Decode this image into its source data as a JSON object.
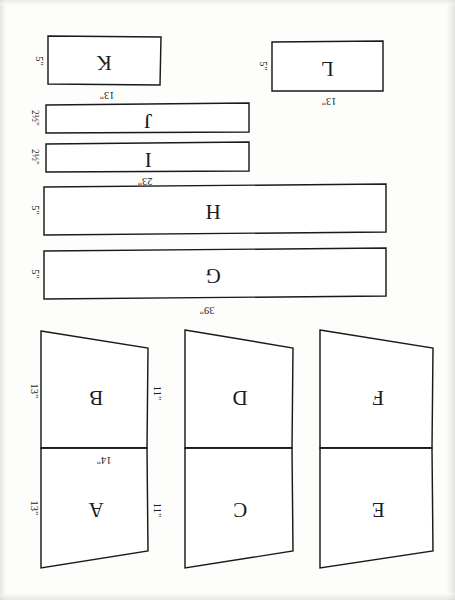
{
  "document": {
    "title": "Hand-drawn pattern cutting layout",
    "orientation_note": "All lettering is rotated 180 degrees",
    "ink_color": "#1a1a1a",
    "paper_color": "#fdfdfb"
  },
  "pieces": [
    {
      "id": "K",
      "label": "K",
      "shape": "rectangle",
      "height_label": "5\"",
      "width_label": "13\"",
      "x": 48,
      "y": 36,
      "w": 113,
      "h": 49
    },
    {
      "id": "L",
      "label": "L",
      "shape": "rectangle",
      "height_label": "5\"",
      "width_label": "13\"",
      "x": 272,
      "y": 41,
      "w": 111,
      "h": 50
    },
    {
      "id": "J",
      "label": "J",
      "shape": "rectangle",
      "height_label": "2½\"",
      "width_label": "23\"",
      "x": 46,
      "y": 104,
      "w": 203,
      "h": 28
    },
    {
      "id": "I",
      "label": "I",
      "shape": "rectangle",
      "height_label": "2½\"",
      "width_label": "23\"",
      "x": 46,
      "y": 142,
      "w": 203,
      "h": 28
    },
    {
      "id": "H",
      "label": "H",
      "shape": "rectangle",
      "height_label": "5\"",
      "width_label": "",
      "x": 44,
      "y": 185,
      "w": 342,
      "h": 48
    },
    {
      "id": "G",
      "label": "G",
      "shape": "rectangle",
      "height_label": "5\"",
      "width_label": "39\"",
      "x": 44,
      "y": 249,
      "w": 342,
      "h": 48
    },
    {
      "id": "B",
      "label": "B",
      "shape": "trapezoid",
      "left_label": "13\"",
      "right_label": "11\"",
      "bottom_label": "14\""
    },
    {
      "id": "A",
      "label": "A",
      "shape": "trapezoid",
      "left_label": "13\"",
      "right_label": "11\"",
      "bottom_label": ""
    },
    {
      "id": "D",
      "label": "D",
      "shape": "trapezoid",
      "left_label": "",
      "right_label": "",
      "bottom_label": ""
    },
    {
      "id": "C",
      "label": "C",
      "shape": "trapezoid",
      "left_label": "",
      "right_label": "",
      "bottom_label": ""
    },
    {
      "id": "F",
      "label": "F",
      "shape": "trapezoid",
      "left_label": "",
      "right_label": "",
      "bottom_label": ""
    },
    {
      "id": "E",
      "label": "E",
      "shape": "trapezoid",
      "left_label": "",
      "right_label": "",
      "bottom_label": ""
    }
  ],
  "labels": {
    "K_letter": "K",
    "K_height": "5\"",
    "K_width": "13\"",
    "L_letter": "L",
    "L_height": "5\"",
    "L_width": "13\"",
    "J_letter": "J",
    "J_height": "2½\"",
    "I_letter": "I",
    "I_height": "2½\"",
    "I_width": "23\"",
    "H_letter": "H",
    "H_height": "5\"",
    "G_letter": "G",
    "G_height": "5\"",
    "G_width": "39\"",
    "A_letter": "A",
    "A_left": "13\"",
    "A_right": "11\"",
    "B_letter": "B",
    "B_left": "13\"",
    "B_right": "11\"",
    "B_bottom": "14\"",
    "C_letter": "C",
    "D_letter": "D",
    "E_letter": "E",
    "F_letter": "F"
  }
}
